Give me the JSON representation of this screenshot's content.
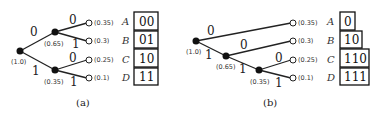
{
  "figure_a": {
    "caption": "(a)",
    "root_prob": "(1.0)",
    "node_upper_prob": "(0.65)",
    "node_lower_prob": "(0.35)",
    "edge_labels": [
      "0",
      "1",
      "0",
      "1",
      "0",
      "1"
    ],
    "leaves": [
      {
        "prob": "(0.35)",
        "symbol": "A",
        "code": "00"
      },
      {
        "prob": "(0.3)",
        "symbol": "B",
        "code": "01"
      },
      {
        "prob": "(0.25)",
        "symbol": "C",
        "code": "10"
      },
      {
        "prob": "(0.1)",
        "symbol": "D",
        "code": "11"
      }
    ]
  },
  "figure_b": {
    "caption": "(b)",
    "root_prob": "(1.0)",
    "node2_prob": "(0.65)",
    "node3_prob": "(0.35)",
    "edge_labels": [
      "0",
      "1",
      "0",
      "1",
      "0",
      "1"
    ],
    "leaves": [
      {
        "prob": "(0.35)",
        "symbol": "A",
        "code": "0"
      },
      {
        "prob": "(0.3)",
        "symbol": "B",
        "code": "10"
      },
      {
        "prob": "(0.25)",
        "symbol": "C",
        "code": "110"
      },
      {
        "prob": "(0.1)",
        "symbol": "D",
        "code": "111"
      }
    ]
  }
}
